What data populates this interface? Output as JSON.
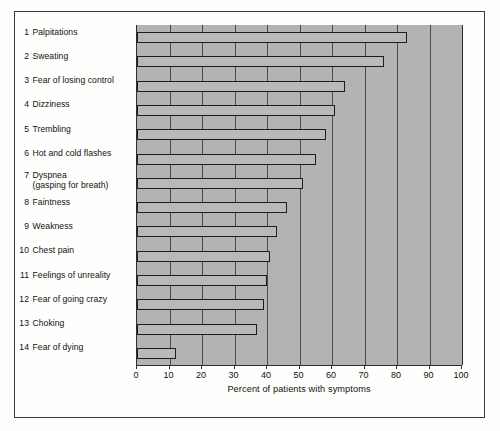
{
  "chart_data": {
    "type": "bar",
    "orientation": "horizontal",
    "title": "",
    "xlabel": "Percent of patients with symptoms",
    "ylabel": "",
    "xlim": [
      0,
      100
    ],
    "xticks": [
      0,
      10,
      20,
      30,
      40,
      50,
      60,
      70,
      80,
      90,
      100
    ],
    "grid": true,
    "legend": "none",
    "plot_background_color": "#b3b3b3",
    "bar_fill_color": "#b9b9b9",
    "bar_edge_color": "#1d1d1d",
    "categories": [
      "Palpitations",
      "Sweating",
      "Fear of losing control",
      "Dizziness",
      "Trembling",
      "Hot and cold flashes",
      "Dyspnea (gasping for breath)",
      "Faintness",
      "Weakness",
      "Chest pain",
      "Feelings of unreality",
      "Fear of going crazy",
      "Choking",
      "Fear of dying"
    ],
    "values": [
      83,
      76,
      64,
      61,
      58,
      55,
      51,
      46,
      43,
      41,
      40,
      39,
      37,
      12
    ]
  },
  "axis": {
    "tick_labels": [
      "0",
      "10",
      "20",
      "30",
      "40",
      "50",
      "60",
      "70",
      "80",
      "90",
      "100"
    ],
    "x_axis_title": "Percent of patients with symptoms"
  },
  "labels": [
    {
      "number": "1",
      "text": "Palpitations",
      "sub": ""
    },
    {
      "number": "2",
      "text": "Sweating",
      "sub": ""
    },
    {
      "number": "3",
      "text": "Fear of losing control",
      "sub": ""
    },
    {
      "number": "4",
      "text": "Dizziness",
      "sub": ""
    },
    {
      "number": "5",
      "text": "Trembling",
      "sub": ""
    },
    {
      "number": "6",
      "text": "Hot and cold flashes",
      "sub": ""
    },
    {
      "number": "7",
      "text": "Dyspnea",
      "sub": "(gasping for breath)"
    },
    {
      "number": "8",
      "text": "Faintness",
      "sub": ""
    },
    {
      "number": "9",
      "text": "Weakness",
      "sub": ""
    },
    {
      "number": "10",
      "text": "Chest pain",
      "sub": ""
    },
    {
      "number": "11",
      "text": "Feelings of unreality",
      "sub": ""
    },
    {
      "number": "12",
      "text": "Fear of going crazy",
      "sub": ""
    },
    {
      "number": "13",
      "text": "Choking",
      "sub": ""
    },
    {
      "number": "14",
      "text": "Fear of dying",
      "sub": ""
    }
  ],
  "colors": {
    "plot_background": "#b3b3b3",
    "bar_fill": "#b9b9b9",
    "bar_edge": "#1d1d1d",
    "frame_border": "#3a3a3a",
    "page_background": "#fefefc",
    "text": "#111111"
  }
}
